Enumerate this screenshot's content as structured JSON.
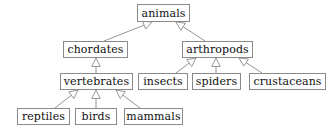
{
  "diagram": {
    "type": "class-inheritance-hierarchy",
    "notation": "uml-generalization",
    "canvas": {
      "width": 332,
      "height": 136
    },
    "style": {
      "background_color": "#ffffff",
      "box_fill_color": "#ffffff",
      "box_border_color": "#8a8a8a",
      "text_color": "#101010",
      "edge_color": "#8a8a8a",
      "arrowhead_fill_color": "#ffffff",
      "arrowhead_border_color": "#8a8a8a",
      "arrowhead_shape": "hollow-triangle"
    },
    "nodes": [
      {
        "id": "animals",
        "label": "animals",
        "x": 137,
        "y": 4,
        "w": 53,
        "h": 18,
        "level": 0
      },
      {
        "id": "chordates",
        "label": "chordates",
        "x": 63,
        "y": 41,
        "w": 65,
        "h": 17,
        "level": 1
      },
      {
        "id": "arthropods",
        "label": "arthropods",
        "x": 182,
        "y": 41,
        "w": 71,
        "h": 17,
        "level": 1
      },
      {
        "id": "vertebrates",
        "label": "vertebrates",
        "x": 60,
        "y": 73,
        "w": 73,
        "h": 17,
        "level": 2
      },
      {
        "id": "insects",
        "label": "insects",
        "x": 138,
        "y": 73,
        "w": 50,
        "h": 17,
        "level": 2
      },
      {
        "id": "spiders",
        "label": "spiders",
        "x": 192,
        "y": 73,
        "w": 49,
        "h": 17,
        "level": 2
      },
      {
        "id": "crustaceans",
        "label": "crustaceans",
        "x": 249,
        "y": 73,
        "w": 77,
        "h": 17,
        "level": 2
      },
      {
        "id": "reptiles",
        "label": "reptiles",
        "x": 17,
        "y": 108,
        "w": 53,
        "h": 17,
        "level": 3
      },
      {
        "id": "birds",
        "label": "birds",
        "x": 75,
        "y": 108,
        "w": 42,
        "h": 17,
        "level": 3
      },
      {
        "id": "mammals",
        "label": "mammals",
        "x": 124,
        "y": 108,
        "w": 59,
        "h": 17,
        "level": 3
      }
    ],
    "edges": [
      {
        "id": "e1",
        "from": "chordates",
        "to": "animals",
        "relation": "generalization",
        "x1": 104,
        "y1": 41,
        "x2": 152,
        "y2": 22
      },
      {
        "id": "e2",
        "from": "arthropods",
        "to": "animals",
        "relation": "generalization",
        "x1": 205,
        "y1": 41,
        "x2": 176,
        "y2": 22
      },
      {
        "id": "e3",
        "from": "vertebrates",
        "to": "chordates",
        "relation": "generalization",
        "x1": 96,
        "y1": 73,
        "x2": 96,
        "y2": 58
      },
      {
        "id": "e4",
        "from": "insects",
        "to": "arthropods",
        "relation": "generalization",
        "x1": 176,
        "y1": 73,
        "x2": 196,
        "y2": 58
      },
      {
        "id": "e5",
        "from": "spiders",
        "to": "arthropods",
        "relation": "generalization",
        "x1": 216,
        "y1": 73,
        "x2": 216,
        "y2": 58
      },
      {
        "id": "e6",
        "from": "crustaceans",
        "to": "arthropods",
        "relation": "generalization",
        "x1": 262,
        "y1": 73,
        "x2": 239,
        "y2": 58
      },
      {
        "id": "e7",
        "from": "reptiles",
        "to": "vertebrates",
        "relation": "generalization",
        "x1": 55,
        "y1": 108,
        "x2": 78,
        "y2": 90
      },
      {
        "id": "e8",
        "from": "birds",
        "to": "vertebrates",
        "relation": "generalization",
        "x1": 96,
        "y1": 108,
        "x2": 96,
        "y2": 90
      },
      {
        "id": "e9",
        "from": "mammals",
        "to": "vertebrates",
        "relation": "generalization",
        "x1": 140,
        "y1": 108,
        "x2": 116,
        "y2": 90
      }
    ]
  }
}
